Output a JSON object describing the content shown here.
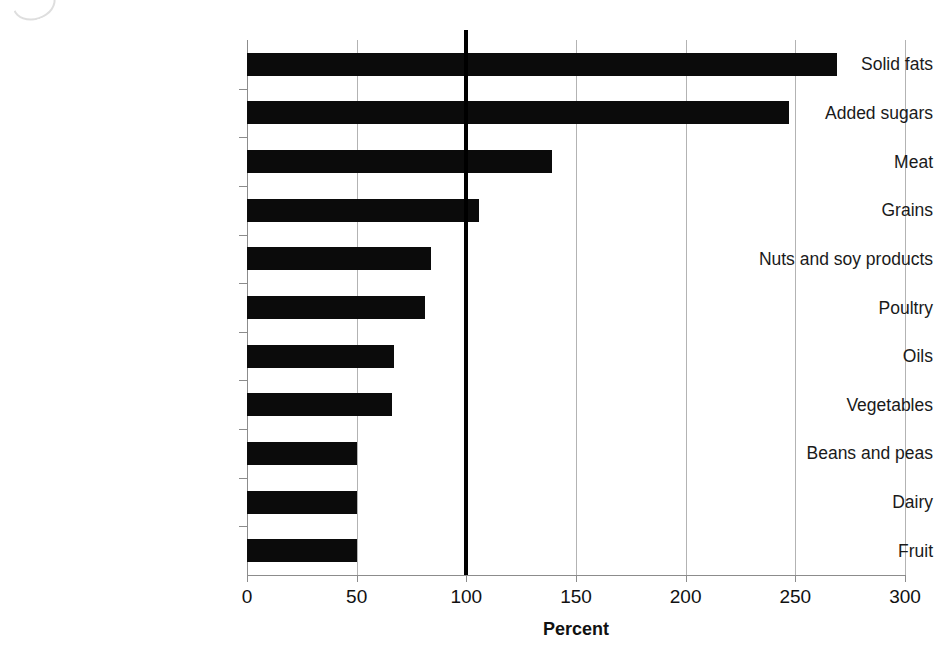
{
  "chart_data": {
    "type": "bar",
    "orientation": "horizontal",
    "title": "",
    "subtitle": "",
    "xlabel": "Percent",
    "ylabel": "",
    "categories": [
      "Solid fats",
      "Added sugars",
      "Meat",
      "Grains",
      "Nuts and soy products",
      "Poultry",
      "Oils",
      "Vegetables",
      "Beans and peas",
      "Dairy",
      "Fruit"
    ],
    "values": [
      269,
      247,
      139,
      106,
      84,
      81,
      67,
      66,
      50,
      50,
      50
    ],
    "xlim": [
      0,
      300
    ],
    "xticks": [
      0,
      50,
      100,
      150,
      200,
      250,
      300
    ],
    "xtick_labels": [
      "0",
      "50",
      "100",
      "150",
      "200",
      "250",
      "300"
    ],
    "grid": true,
    "grid_axis": "x",
    "legend": false,
    "legend_position": "none",
    "reference_line": {
      "value": 100,
      "style": "solid-thick",
      "color": "#000000"
    },
    "bar_color": "#0b0b0b",
    "gridline_color": "#b3b3b3",
    "axis_color": "#8c8c8c",
    "background": "#ffffff"
  }
}
